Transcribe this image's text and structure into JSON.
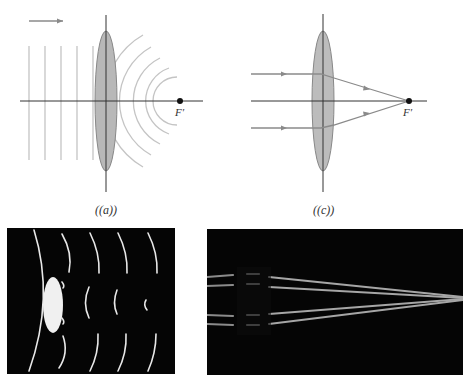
{
  "figure": {
    "panel_a": {
      "caption": "((a))",
      "focal_label": "F′",
      "description": "Plane wavefronts pass through converging lens and become spherical wavefronts converging to focal point F′",
      "plane_wavefront_count": 5,
      "spherical_wavefront_count": 5
    },
    "panel_c": {
      "caption": "((c))",
      "focal_label": "F′",
      "description": "Parallel rays refracted by converging lens meet at focal point F′",
      "ray_count": 3
    },
    "photo_left": {
      "description": "Photograph of wavefronts passing through a lens converging to a point"
    },
    "photo_right": {
      "description": "Photograph of parallel light beams converging through a lens to a focal point"
    },
    "colors": {
      "lens_fill": "#b8b8b8",
      "lens_stroke": "#888888",
      "axis": "#333333",
      "wavefront": "#bdbdbd",
      "ray": "#8a8a8a",
      "focal_dot": "#111111",
      "photo_bg": "#050505"
    }
  }
}
